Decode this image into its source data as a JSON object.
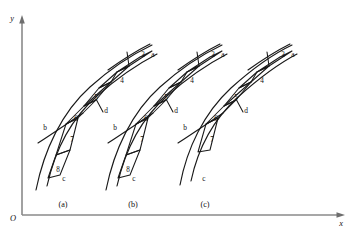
{
  "figure": {
    "background_color": "#ffffff",
    "line_color": "#1a1a1a",
    "axis_color": "#8a8a8a",
    "axes": {
      "y_label": "y",
      "x_label": "x",
      "origin_label": "O"
    },
    "groups": [
      {
        "id": "a",
        "caption": "(a)",
        "caption_x": 63,
        "caption_y": 207,
        "offset_x": 0,
        "point_labels": [
          {
            "text": "a",
            "x": 153,
            "y": 57
          },
          {
            "text": "b",
            "x": 45,
            "y": 130
          },
          {
            "text": "c",
            "x": 64,
            "y": 181
          },
          {
            "text": "d",
            "x": 102,
            "y": 108
          }
        ],
        "cell_labels": [
          {
            "text": "3",
            "x": 143,
            "y": 57
          },
          {
            "text": "4",
            "x": 122,
            "y": 83
          },
          {
            "text": "5",
            "x": 96,
            "y": 100
          },
          {
            "text": "6",
            "x": 76,
            "y": 121
          },
          {
            "text": "7",
            "x": 72,
            "y": 142
          },
          {
            "text": "8",
            "x": 58,
            "y": 172
          }
        ]
      },
      {
        "id": "b",
        "caption": "(b)",
        "caption_x": 133,
        "caption_y": 207,
        "offset_x": 70,
        "point_labels": [
          {
            "text": "a",
            "x": 223,
            "y": 57
          },
          {
            "text": "b",
            "x": 115,
            "y": 130
          },
          {
            "text": "c",
            "x": 134,
            "y": 181
          },
          {
            "text": "d",
            "x": 172,
            "y": 108
          }
        ],
        "cell_labels": [
          {
            "text": "3",
            "x": 213,
            "y": 57
          },
          {
            "text": "4",
            "x": 192,
            "y": 83
          },
          {
            "text": "5",
            "x": 166,
            "y": 100
          },
          {
            "text": "6",
            "x": 146,
            "y": 121
          },
          {
            "text": "7",
            "x": 142,
            "y": 142
          },
          {
            "text": "8",
            "x": 128,
            "y": 172
          }
        ]
      },
      {
        "id": "c",
        "caption": "(c)",
        "caption_x": 205,
        "caption_y": 207,
        "offset_x": 140,
        "point_labels": [
          {
            "text": "a",
            "x": 293,
            "y": 57
          },
          {
            "text": "b",
            "x": 185,
            "y": 130
          },
          {
            "text": "c",
            "x": 204,
            "y": 181
          },
          {
            "text": "d",
            "x": 242,
            "y": 108
          }
        ],
        "cell_labels": [
          {
            "text": "3",
            "x": 283,
            "y": 57
          },
          {
            "text": "4",
            "x": 262,
            "y": 83
          },
          {
            "text": "5",
            "x": 236,
            "y": 100
          },
          {
            "text": "6",
            "x": 216,
            "y": 121
          },
          {
            "text": "7",
            "x": 212,
            "y": 142
          }
        ]
      }
    ]
  }
}
